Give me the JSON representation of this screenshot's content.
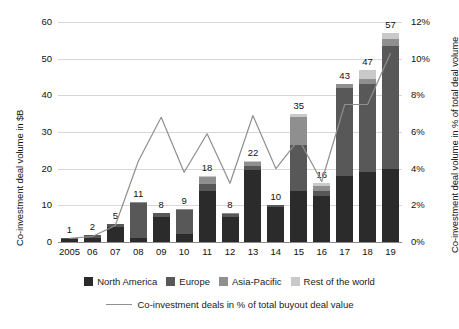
{
  "chart_data": {
    "type": "bar",
    "title": "",
    "subtitle": "",
    "xlabel": "",
    "ylabel": "Co-investment deal volume in $B",
    "ylabel_right": "Co-investment deal volume in % of total deal volume",
    "ylim": [
      0,
      60
    ],
    "ylim_right": [
      0,
      12
    ],
    "grid": true,
    "legend_position": "bottom",
    "stacked": true,
    "categories": [
      "2005",
      "06",
      "07",
      "08",
      "09",
      "10",
      "11",
      "12",
      "13",
      "14",
      "15",
      "16",
      "17",
      "18",
      "19"
    ],
    "yticks": [
      "0",
      "10",
      "20",
      "30",
      "40",
      "50",
      "60"
    ],
    "yticks_right": [
      "0%",
      "2%",
      "4%",
      "6%",
      "8%",
      "10%",
      "12%"
    ],
    "bar_totals": [
      1,
      2,
      5,
      11,
      8,
      9,
      18,
      8,
      22,
      10,
      35,
      16,
      43,
      47,
      57
    ],
    "series": [
      {
        "name": "North America",
        "color": "#2b2b2b",
        "values": [
          0.8,
          1.2,
          4.2,
          1.0,
          6.8,
          2.2,
          14.0,
          6.8,
          19.5,
          9.6,
          14.0,
          12.6,
          18.0,
          19.0,
          20.0
        ]
      },
      {
        "name": "Europe",
        "color": "#585858",
        "values": [
          0.2,
          0.6,
          0.6,
          9.6,
          1.0,
          6.6,
          1.8,
          0.8,
          1.2,
          0.4,
          12.5,
          1.4,
          24.0,
          24.0,
          33.5
        ]
      },
      {
        "name": "Asia-Pacific",
        "color": "#8f8f8f",
        "values": [
          0.0,
          0.2,
          0.2,
          0.4,
          0.2,
          0.2,
          2.0,
          0.4,
          1.0,
          0.0,
          7.5,
          1.2,
          1.0,
          1.5,
          2.0
        ]
      },
      {
        "name": "Rest of the world",
        "color": "#c9c9c9",
        "values": [
          0.0,
          0.0,
          0.0,
          0.0,
          0.0,
          0.0,
          0.2,
          0.0,
          0.3,
          0.0,
          1.0,
          0.8,
          0.0,
          2.5,
          1.5
        ]
      }
    ],
    "line_series": {
      "name": "Co-investment deals in % of total buyout deal value",
      "color": "#8f8f8f",
      "axis": "right",
      "unit": "%",
      "values": [
        0.2,
        0.3,
        0.9,
        4.4,
        6.8,
        3.8,
        5.9,
        3.2,
        6.9,
        4.0,
        5.6,
        3.3,
        7.5,
        7.5,
        10.3
      ]
    }
  },
  "legend": {
    "series_items": [
      {
        "label": "North America"
      },
      {
        "label": "Europe"
      },
      {
        "label": "Asia-Pacific"
      },
      {
        "label": "Rest of the world"
      }
    ],
    "line_item": {
      "label": "Co-investment deals in % of total buyout deal value"
    }
  }
}
